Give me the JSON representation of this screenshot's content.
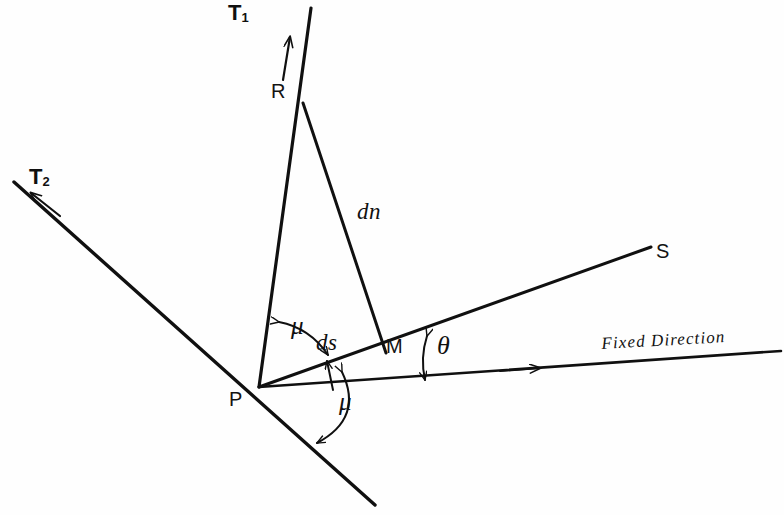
{
  "figure": {
    "kind": "geometry-diagram",
    "background_color": "#fefefe",
    "stroke_color": "#101010",
    "width": 784,
    "height": 515
  },
  "labels": {
    "tangent_1": "T",
    "tangent_1_sub": "1",
    "tangent_2": "T",
    "tangent_2_sub": "2",
    "point_r": "R",
    "point_p": "P",
    "point_m": "M",
    "point_s": "S",
    "segment_dn": "dn",
    "segment_ds": "ds",
    "angle_mu_upper": "μ",
    "angle_mu_lower": "μ",
    "angle_theta": "θ",
    "fixed_direction": "Fixed Direction"
  },
  "geometry": {
    "points": {
      "P": [
        259,
        387
      ],
      "R": [
        303,
        103
      ],
      "M": [
        386,
        353
      ],
      "S_end": [
        651,
        247
      ],
      "T1_tip": [
        311,
        8
      ],
      "T1_arrow": [
        289,
        42
      ],
      "T2_tip": [
        14,
        182
      ],
      "T2_arrow": [
        46,
        205
      ],
      "T2_lower_end": [
        375,
        505
      ],
      "FD_right_end": [
        781,
        351
      ],
      "FD_arrow": [
        543,
        368
      ]
    },
    "lines": [
      {
        "name": "tangent-line-T1",
        "from": [
          311,
          8
        ],
        "to": [
          259,
          387
        ]
      },
      {
        "name": "tangent-line-T2",
        "from": [
          14,
          182
        ],
        "to": [
          375,
          505
        ]
      },
      {
        "name": "chord-dn-RM",
        "from": [
          303,
          103
        ],
        "to": [
          386,
          353
        ]
      },
      {
        "name": "ray-PS",
        "from": [
          259,
          387
        ],
        "to": [
          651,
          247
        ]
      },
      {
        "name": "fixed-direction-line",
        "from": [
          259,
          387
        ],
        "to": [
          781,
          351
        ]
      }
    ],
    "arcs": [
      {
        "name": "angle-arc-mu-upper",
        "at": "P",
        "between": [
          "PR",
          "PS"
        ],
        "double_headed": true
      },
      {
        "name": "angle-arc-mu-lower",
        "at": "P",
        "between": [
          "PS",
          "PT2-extension"
        ],
        "double_headed": true
      },
      {
        "name": "angle-arc-theta",
        "at": "PS-FD-intersection",
        "between": [
          "PS",
          "fixed-direction"
        ],
        "double_headed": true
      }
    ]
  }
}
